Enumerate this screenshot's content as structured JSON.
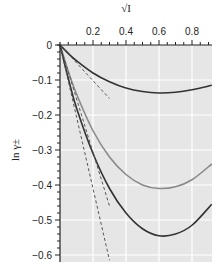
{
  "chart_data": {
    "type": "line",
    "title": "",
    "xlabel": "√I",
    "ylabel": "ln γ±",
    "xlim": [
      0,
      0.92
    ],
    "ylim": [
      -0.62,
      0
    ],
    "x_ticks": [
      0.2,
      0.4,
      0.6,
      0.8
    ],
    "x_tick_labels": [
      "0.2",
      "0.4",
      "0.6",
      "0.8"
    ],
    "y_ticks": [
      0,
      -0.1,
      -0.2,
      -0.3,
      -0.4,
      -0.5,
      -0.6
    ],
    "y_tick_labels": [
      "0",
      "−0.1",
      "−0.2",
      "−0.3",
      "−0.4",
      "−0.5",
      "−0.6"
    ],
    "x_axis_position": "top",
    "grid": true,
    "legend": "none",
    "series": [
      {
        "name": "curve-1 (solid, dark)",
        "style": "solid",
        "color": "#333333",
        "x": [
          0,
          0.05,
          0.1,
          0.2,
          0.3,
          0.4,
          0.5,
          0.6,
          0.7,
          0.8,
          0.92
        ],
        "y": [
          0,
          -0.024,
          -0.045,
          -0.08,
          -0.105,
          -0.123,
          -0.133,
          -0.137,
          -0.135,
          -0.128,
          -0.115
        ]
      },
      {
        "name": "curve-2 (solid, gray)",
        "style": "solid",
        "color": "#8a8a8a",
        "x": [
          0,
          0.05,
          0.1,
          0.2,
          0.3,
          0.4,
          0.5,
          0.6,
          0.7,
          0.8,
          0.92
        ],
        "y": [
          0,
          -0.075,
          -0.14,
          -0.245,
          -0.32,
          -0.37,
          -0.4,
          -0.41,
          -0.405,
          -0.385,
          -0.34
        ]
      },
      {
        "name": "curve-3 (solid, dark)",
        "style": "solid",
        "color": "#333333",
        "x": [
          0,
          0.05,
          0.1,
          0.2,
          0.3,
          0.4,
          0.5,
          0.6,
          0.7,
          0.8,
          0.92
        ],
        "y": [
          0,
          -0.095,
          -0.18,
          -0.31,
          -0.41,
          -0.48,
          -0.525,
          -0.545,
          -0.54,
          -0.515,
          -0.455
        ]
      },
      {
        "name": "limiting-law-1 (dashed)",
        "style": "dashed",
        "color": "#555555",
        "x": [
          0,
          0.3
        ],
        "y": [
          0,
          -0.153
        ]
      },
      {
        "name": "limiting-law-2 (dashed)",
        "style": "dashed",
        "color": "#555555",
        "x": [
          0,
          0.3
        ],
        "y": [
          0,
          -0.46
        ]
      },
      {
        "name": "limiting-law-3 (dashed)",
        "style": "dashed",
        "color": "#555555",
        "x": [
          0,
          0.3
        ],
        "y": [
          0,
          -0.615
        ]
      }
    ]
  },
  "colors": {
    "plot_background": "#e6e6e6",
    "grid": "#ffffff",
    "axis": "#222222"
  }
}
